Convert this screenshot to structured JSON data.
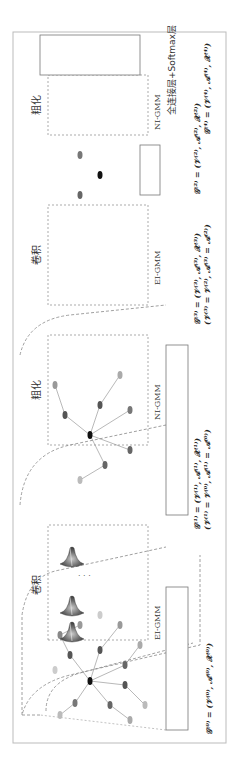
{
  "figure": {
    "orientation": "rotated-90-ccw",
    "stages": [
      {
        "id": "input-graph",
        "formula": "𝒢⁽⁰⁾ = (𝒱⁽⁰⁾, 𝒜⁽⁰⁾, 𝒳⁽⁰⁾)"
      },
      {
        "id": "conv-1",
        "label": "卷积",
        "sublabel": "EI-GMM"
      },
      {
        "id": "graph-1",
        "formula": "𝒢⁽¹⁾ = (𝒱⁽¹⁾, 𝒜⁽¹⁾, 𝒳⁽¹⁾)",
        "formula2": "(𝒱⁽¹⁾ = 𝒱⁽⁰⁾, 𝒜⁽¹⁾ = 𝒜⁽⁰⁾)"
      },
      {
        "id": "pool-1",
        "label": "粗化",
        "sublabel": "NI-GMM"
      },
      {
        "id": "conv-2",
        "label": "卷积",
        "sublabel": "EI-GMM"
      },
      {
        "id": "graph-2",
        "formula": "𝒢⁽²⁾ = (𝒱⁽²⁾, 𝒜⁽²⁾, 𝒳⁽²⁾)"
      },
      {
        "id": "graph-3",
        "formula": "𝒢⁽³⁾ = (𝒱⁽³⁾, 𝒜⁽³⁾, 𝒳⁽³⁾)",
        "formula2": "(𝒱⁽³⁾ = 𝒱⁽²⁾, 𝒜⁽³⁾ = 𝒜⁽²⁾)"
      },
      {
        "id": "pool-2",
        "label": "粗化",
        "sublabel": "NI-GMM"
      },
      {
        "id": "graph-4",
        "formula": "𝒢⁽⁴⁾ = (𝒱⁽⁴⁾, 𝒜⁽⁴⁾, 𝒳⁽⁴⁾)"
      },
      {
        "id": "fc-softmax",
        "label": "全连接层+Softmax层"
      }
    ],
    "ellipsis": "· · ·",
    "fc_dots": "···",
    "colors": {
      "frame": "#bbbbbb",
      "dashed": "#888888",
      "node_dark": "#555555",
      "node_mid": "#8a8a8a",
      "node_light": "#c4c4c4",
      "node_center": "#111111",
      "gaussian": "#5a5a5a"
    }
  }
}
